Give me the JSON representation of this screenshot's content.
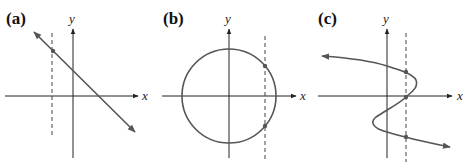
{
  "figure": {
    "panels": [
      {
        "label": "(a)",
        "x_axis": "x",
        "y_axis": "y",
        "description": "straight line crossing dashed vertical line once"
      },
      {
        "label": "(b)",
        "x_axis": "x",
        "y_axis": "y",
        "description": "circle crossing dashed vertical line twice"
      },
      {
        "label": "(c)",
        "x_axis": "x",
        "y_axis": "y",
        "description": "S-shaped curve crossing dashed vertical line three times"
      }
    ],
    "colors": {
      "curve": "#555555",
      "axes": "#222222",
      "dashed": "#444444"
    }
  }
}
